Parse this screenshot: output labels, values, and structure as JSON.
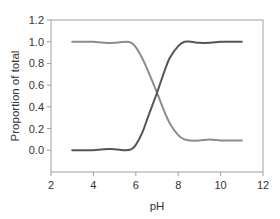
{
  "chart_data": {
    "type": "line",
    "title": "",
    "xlabel": "pH",
    "ylabel": "Proportion of total",
    "xlim": [
      2,
      12
    ],
    "ylim": [
      -0.2,
      1.2
    ],
    "x_ticks": [
      "2",
      "4",
      "6",
      "8",
      "10",
      "12"
    ],
    "y_ticks": [
      "0.0",
      "0.2",
      "0.4",
      "0.6",
      "0.8",
      "1.0",
      "1.2"
    ],
    "grid": false,
    "legend": null,
    "series": [
      {
        "name": "decreasing species",
        "color": "#8c8c8c",
        "x": [
          3.0,
          3.5,
          4.0,
          4.5,
          5.0,
          5.5,
          5.8,
          6.0,
          6.3,
          6.6,
          7.0,
          7.3,
          7.6,
          8.0,
          8.3,
          8.6,
          9.0,
          9.5,
          10.0,
          10.5,
          11.0
        ],
        "values": [
          1.0,
          1.0,
          1.0,
          0.99,
          0.99,
          1.0,
          0.99,
          0.95,
          0.85,
          0.72,
          0.53,
          0.38,
          0.25,
          0.14,
          0.1,
          0.09,
          0.09,
          0.1,
          0.09,
          0.09,
          0.09
        ]
      },
      {
        "name": "increasing species",
        "color": "#555555",
        "x": [
          3.0,
          3.5,
          4.0,
          4.5,
          5.0,
          5.5,
          5.8,
          6.0,
          6.3,
          6.6,
          7.0,
          7.3,
          7.6,
          8.0,
          8.3,
          8.6,
          9.0,
          9.5,
          10.0,
          10.5,
          11.0
        ],
        "values": [
          0.0,
          0.0,
          0.0,
          0.01,
          0.01,
          0.0,
          0.01,
          0.05,
          0.16,
          0.32,
          0.53,
          0.7,
          0.85,
          0.96,
          1.0,
          1.0,
          0.99,
          0.99,
          1.0,
          1.0,
          1.0
        ]
      }
    ]
  }
}
